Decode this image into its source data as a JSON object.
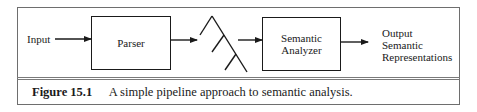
{
  "diagram": {
    "input_label": "Input",
    "parser_label": "Parser",
    "tree_icon": "parse-tree-icon",
    "analyzer_label_line1": "Semantic",
    "analyzer_label_line2": "Analyzer",
    "output_line1": "Output",
    "output_line2": "Semantic",
    "output_line3": "Representations",
    "colors": {
      "stroke": "#1a1a1a",
      "frame": "#6e6e6e",
      "background": "#ffffff"
    }
  },
  "caption": {
    "figure_number": "Figure 15.1",
    "text": "A simple pipeline approach to semantic analysis."
  }
}
